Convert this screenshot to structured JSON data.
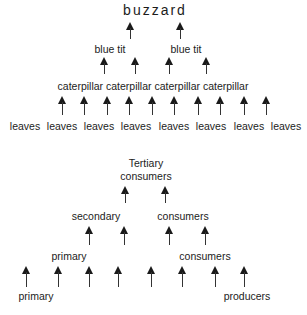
{
  "top_diagram": {
    "title": "buzzard",
    "level2": [
      "blue tit",
      "blue tit"
    ],
    "level1": "caterpillar caterpillar caterpillar caterpillar",
    "level0": [
      "leaves",
      "leaves",
      "leaves",
      "leaves",
      "leaves",
      "leaves",
      "leaves",
      "leaves"
    ]
  },
  "bottom_diagram": {
    "top_line1": "Tertiary",
    "top_line2": "consumers",
    "secondary_left": "secondary",
    "secondary_right": "consumers",
    "primary_left": "primary",
    "primary_right": "consumers",
    "producers_left": "primary",
    "producers_right": "producers"
  },
  "arrow_icon": "up-arrow-icon"
}
